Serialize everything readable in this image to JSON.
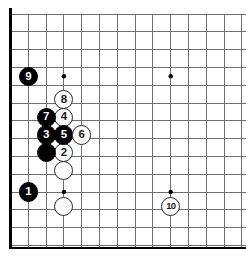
{
  "figure": {
    "board": {
      "background_color": "#ffffff",
      "line_color": "#6f6f6f",
      "edge_color": "#000000",
      "star_color": "#000000",
      "cell_size": 17.8,
      "origin_x": 10.5,
      "origin_y": 14.0,
      "columns": 14,
      "rows": 14,
      "edges_visible": [
        "left",
        "bottom"
      ],
      "star_points": [
        {
          "col": 3,
          "row": 3.5
        },
        {
          "col": 9,
          "row": 3.5
        },
        {
          "col": 3,
          "row": 10
        },
        {
          "col": 9,
          "row": 10
        }
      ]
    },
    "stones": [
      {
        "id": "stone-1",
        "color": "black",
        "label": "1",
        "col": 1,
        "row": 10
      },
      {
        "id": "stone-2",
        "color": "white",
        "label": "2",
        "col": 3,
        "row": 7.8
      },
      {
        "id": "stone-3",
        "color": "black",
        "label": "3",
        "col": 2,
        "row": 6.8
      },
      {
        "id": "stone-4",
        "color": "white",
        "label": "4",
        "col": 3,
        "row": 5.8
      },
      {
        "id": "stone-5",
        "color": "black",
        "label": "5",
        "col": 3,
        "row": 6.8
      },
      {
        "id": "stone-6",
        "color": "white",
        "label": "6",
        "col": 4,
        "row": 6.8
      },
      {
        "id": "stone-7",
        "color": "black",
        "label": "7",
        "col": 2,
        "row": 5.8
      },
      {
        "id": "stone-8",
        "color": "white",
        "label": "8",
        "col": 3,
        "row": 4.8
      },
      {
        "id": "stone-9",
        "color": "black",
        "label": "9",
        "col": 1,
        "row": 3.5
      },
      {
        "id": "stone-10",
        "color": "white",
        "label": "10",
        "col": 9,
        "row": 10.8
      },
      {
        "id": "stone-black-plain",
        "color": "black",
        "label": "",
        "col": 2,
        "row": 7.8
      },
      {
        "id": "stone-white-plain-a",
        "color": "white",
        "label": "",
        "col": 3,
        "row": 8.8
      },
      {
        "id": "stone-white-plain-b",
        "color": "white",
        "label": "",
        "col": 3,
        "row": 10.8
      }
    ]
  }
}
